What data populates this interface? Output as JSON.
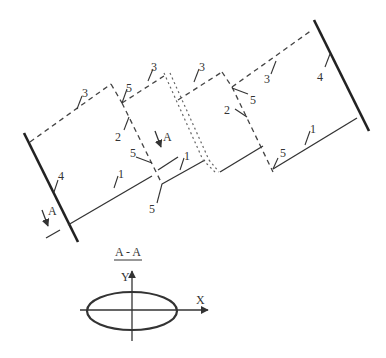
{
  "diagram": {
    "labels": {
      "one": "1",
      "two": "2",
      "three": "3",
      "four": "4",
      "five": "5",
      "section_marker": "A"
    },
    "section": {
      "title": "A - A",
      "axis_x": "X",
      "axis_y": "Y"
    },
    "colors": {
      "line": "#333333",
      "background": "#ffffff"
    }
  }
}
